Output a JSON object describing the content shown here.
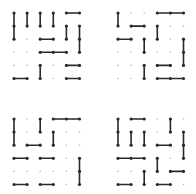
{
  "grid": {
    "cols": 6,
    "rows": 6
  },
  "colors": {
    "line": "#2a2a2a",
    "dot": "#2a2a2a",
    "empty_dot": "#b8b8b8",
    "background": "#ffffff"
  },
  "panels": [
    {
      "name": "top-left",
      "segments": [
        [
          0,
          0,
          0,
          2
        ],
        [
          1,
          0,
          1,
          1
        ],
        [
          2,
          0,
          2,
          1
        ],
        [
          3,
          0,
          3,
          1
        ],
        [
          4,
          0,
          5,
          0
        ],
        [
          4,
          1,
          4,
          2
        ],
        [
          5,
          1,
          5,
          3
        ],
        [
          2,
          2,
          3,
          2
        ],
        [
          2,
          3,
          4,
          3
        ],
        [
          2,
          4,
          2,
          5
        ],
        [
          4,
          4,
          5,
          4
        ],
        [
          0,
          5,
          1,
          5
        ],
        [
          4,
          5,
          5,
          5
        ]
      ]
    },
    {
      "name": "top-right",
      "segments": [
        [
          0,
          0,
          0,
          1
        ],
        [
          3,
          0,
          5,
          0
        ],
        [
          1,
          1,
          2,
          1
        ],
        [
          3,
          1,
          3,
          2
        ],
        [
          0,
          2,
          1,
          2
        ],
        [
          2,
          2,
          2,
          3
        ],
        [
          5,
          2,
          5,
          4
        ],
        [
          2,
          4,
          2,
          5
        ],
        [
          3,
          4,
          4,
          4
        ],
        [
          3,
          5,
          5,
          5
        ]
      ]
    },
    {
      "name": "bottom-left",
      "segments": [
        [
          0,
          0,
          0,
          2
        ],
        [
          2,
          0,
          2,
          1
        ],
        [
          3,
          0,
          5,
          0
        ],
        [
          3,
          1,
          3,
          2
        ],
        [
          1,
          2,
          2,
          2
        ],
        [
          0,
          3,
          1,
          3
        ],
        [
          2,
          3,
          3,
          3
        ],
        [
          5,
          3,
          5,
          5
        ],
        [
          0,
          5,
          1,
          5
        ],
        [
          2,
          5,
          3,
          5
        ]
      ]
    },
    {
      "name": "bottom-right",
      "segments": [
        [
          0,
          0,
          0,
          2
        ],
        [
          1,
          0,
          2,
          0
        ],
        [
          4,
          0,
          4,
          1
        ],
        [
          1,
          1,
          1,
          2
        ],
        [
          2,
          1,
          2,
          2
        ],
        [
          5,
          1,
          5,
          3
        ],
        [
          3,
          2,
          4,
          2
        ],
        [
          0,
          3,
          2,
          3
        ],
        [
          3,
          3,
          3,
          4
        ],
        [
          4,
          4,
          5,
          4
        ],
        [
          2,
          4,
          2,
          5
        ],
        [
          0,
          5,
          1,
          5
        ],
        [
          3,
          5,
          4,
          5
        ]
      ]
    }
  ]
}
